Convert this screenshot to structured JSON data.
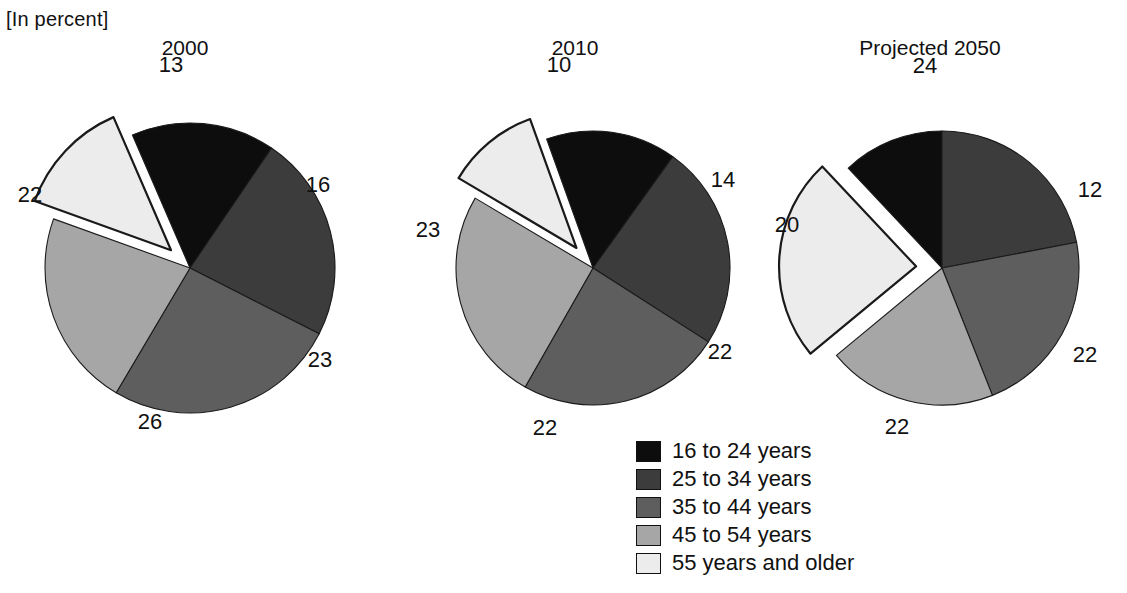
{
  "unit_label": "[In percent]",
  "legend": {
    "items": [
      {
        "label": "16 to 24 years",
        "color": "#0d0d0d"
      },
      {
        "label": "25 to 34 years",
        "color": "#3c3c3c"
      },
      {
        "label": "35 to 44 years",
        "color": "#5e5e5e"
      },
      {
        "label": "45 to 54 years",
        "color": "#a6a6a6"
      },
      {
        "label": "55 years and older",
        "color": "#ececec"
      }
    ]
  },
  "charts": [
    {
      "title": "2000",
      "center_x": 190,
      "center_y": 268,
      "radius": 145,
      "title_x": 185,
      "title_y": 36,
      "values": [
        16,
        23,
        26,
        22,
        13
      ],
      "labels": [
        "16",
        "23",
        "26",
        "22",
        "13"
      ],
      "label_positions": [
        {
          "x": 318,
          "y": 185
        },
        {
          "x": 320,
          "y": 360
        },
        {
          "x": 150,
          "y": 422
        },
        {
          "x": 30,
          "y": 195
        },
        {
          "x": 171,
          "y": 65
        }
      ]
    },
    {
      "title": "2010",
      "center_x": 593,
      "center_y": 268,
      "radius": 137,
      "title_x": 575,
      "title_y": 36,
      "values": [
        14,
        22,
        22,
        23,
        10
      ],
      "labels": [
        "14",
        "22",
        "22",
        "23",
        "10"
      ],
      "label_positions": [
        {
          "x": 723,
          "y": 180
        },
        {
          "x": 720,
          "y": 352
        },
        {
          "x": 545,
          "y": 428
        },
        {
          "x": 428,
          "y": 230
        },
        {
          "x": 559,
          "y": 65
        }
      ]
    },
    {
      "title": "Projected 2050",
      "center_x": 942,
      "center_y": 268,
      "radius": 137,
      "title_x": 930,
      "title_y": 36,
      "values": [
        12,
        22,
        22,
        20,
        24
      ],
      "labels": [
        "12",
        "22",
        "22",
        "20",
        "24"
      ],
      "label_positions": [
        {
          "x": 1090,
          "y": 190
        },
        {
          "x": 1085,
          "y": 355
        },
        {
          "x": 897,
          "y": 427
        },
        {
          "x": 787,
          "y": 225
        },
        {
          "x": 925,
          "y": 66
        }
      ]
    }
  ],
  "chart_data": {
    "type": "pie",
    "title": "",
    "subtitle": "[In percent]",
    "unit": "percent",
    "categories": [
      "16 to 24 years",
      "25 to 34 years",
      "35 to 44 years",
      "45 to 54 years",
      "55 years and older"
    ],
    "series": [
      {
        "name": "2000",
        "values": [
          16,
          23,
          26,
          22,
          13
        ]
      },
      {
        "name": "2010",
        "values": [
          14,
          22,
          22,
          23,
          10
        ]
      },
      {
        "name": "Projected 2050",
        "values": [
          12,
          22,
          22,
          20,
          24
        ]
      }
    ],
    "colors": [
      "#0d0d0d",
      "#3c3c3c",
      "#5e5e5e",
      "#a6a6a6",
      "#ececec"
    ],
    "exploded_slice": "55 years and older",
    "legend_position": "bottom-center",
    "grid": false
  }
}
